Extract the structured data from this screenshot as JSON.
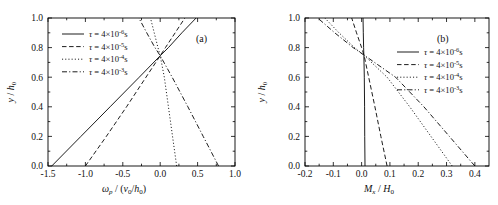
{
  "figure": {
    "background_color": "#ffffff",
    "line_color": "#111111",
    "panels": [
      "a",
      "b"
    ]
  },
  "panel_a": {
    "tag": "(a)",
    "xlabel_main": "ω",
    "xlabel_sub": "p",
    "xlabel_rest": " / (",
    "xlabel_v": "v",
    "xlabel_v_sub": "0",
    "xlabel_slash": "/",
    "xlabel_h": "h",
    "xlabel_h_sub": "0",
    "xlabel_close": ")",
    "xlabel_plain": "ωp / (v0/h0)",
    "ylabel_y": "y",
    "ylabel_slash": " / ",
    "ylabel_h": "h",
    "ylabel_h_sub": "0",
    "ylabel_plain": "y / h0",
    "xticklabels": [
      "-1.5",
      "-1.0",
      "-0.5",
      "0.0",
      "0.5",
      "1.0"
    ],
    "yticklabels": [
      "0.0",
      "0.2",
      "0.4",
      "0.6",
      "0.8",
      "1.0"
    ],
    "legend": [
      {
        "style": "solid",
        "tau": "τ",
        "eq": " = 4×10",
        "exp": "-6",
        "unit": "s"
      },
      {
        "style": "dashed",
        "tau": "τ",
        "eq": " = 4×10",
        "exp": "-5",
        "unit": "s"
      },
      {
        "style": "dotted",
        "tau": "τ",
        "eq": " = 4×10",
        "exp": "-4",
        "unit": "s"
      },
      {
        "style": "dashdot",
        "tau": "τ",
        "eq": " = 4×10",
        "exp": "-3",
        "unit": "s"
      }
    ]
  },
  "panel_b": {
    "tag": "(b)",
    "xlabel_M": "M",
    "xlabel_M_sub": "x",
    "xlabel_slash": " / ",
    "xlabel_H": "H",
    "xlabel_H_sub": "0",
    "xlabel_plain": "Mx / H0",
    "ylabel_y": "y",
    "ylabel_slash": " / ",
    "ylabel_h": "h",
    "ylabel_h_sub": "0",
    "ylabel_plain": "y / h0",
    "xticklabels": [
      "-0.2",
      "-0.1",
      "0.0",
      "0.1",
      "0.2",
      "0.3",
      "0.4"
    ],
    "yticklabels": [
      "0.0",
      "0.2",
      "0.4",
      "0.6",
      "0.8",
      "1.0"
    ],
    "legend": [
      {
        "style": "solid",
        "tau": "τ",
        "eq": " = 4×10",
        "exp": "-6",
        "unit": "s"
      },
      {
        "style": "dashed",
        "tau": "τ",
        "eq": " = 4×10",
        "exp": "-5",
        "unit": "s"
      },
      {
        "style": "dotted",
        "tau": "τ",
        "eq": " = 4×10",
        "exp": "-4",
        "unit": "s"
      },
      {
        "style": "dashdot",
        "tau": "τ",
        "eq": " = 4×10",
        "exp": "-3",
        "unit": "s"
      }
    ]
  },
  "chart_data": [
    {
      "type": "line",
      "panel": "a",
      "title": "(a)",
      "xlabel": "ωp / (v0/h0)",
      "ylabel": "y / h0",
      "xlim": [
        -1.5,
        1.0
      ],
      "ylim": [
        0.0,
        1.0
      ],
      "xticks": [
        -1.5,
        -1.0,
        -0.5,
        0.0,
        0.5,
        1.0
      ],
      "yticks": [
        0.0,
        0.2,
        0.4,
        0.6,
        0.8,
        1.0
      ],
      "grid": false,
      "legend_position": "upper-left",
      "series": [
        {
          "name": "τ = 4×10-6 s",
          "style": "solid",
          "x": [
            -1.45,
            -1.06,
            -0.67,
            -0.28,
            0.0,
            0.11,
            0.29,
            0.48
          ],
          "y": [
            0.0,
            0.2,
            0.4,
            0.6,
            0.745,
            0.8,
            0.9,
            1.0
          ]
        },
        {
          "name": "τ = 4×10-5 s",
          "style": "dashed",
          "x": [
            -1.0,
            -0.72,
            -0.45,
            -0.19,
            0.0,
            0.07,
            0.2,
            0.33
          ],
          "y": [
            0.0,
            0.2,
            0.4,
            0.6,
            0.745,
            0.8,
            0.9,
            1.0
          ]
        },
        {
          "name": "τ = 4×10-4 s",
          "style": "dotted",
          "x": [
            0.22,
            0.165,
            0.11,
            0.055,
            0.0,
            -0.03,
            -0.08,
            -0.13
          ],
          "y": [
            0.0,
            0.2,
            0.4,
            0.6,
            0.745,
            0.8,
            0.9,
            1.0
          ]
        },
        {
          "name": "τ = 4×10-3 s",
          "style": "dashdot",
          "x": [
            0.78,
            0.575,
            0.37,
            0.16,
            0.0,
            -0.07,
            -0.18,
            -0.285
          ],
          "y": [
            0.0,
            0.2,
            0.4,
            0.6,
            0.745,
            0.8,
            0.9,
            1.0
          ]
        }
      ]
    },
    {
      "type": "line",
      "panel": "b",
      "title": "(b)",
      "xlabel": "Mx / H0",
      "ylabel": "y / h0",
      "xlim": [
        -0.2,
        0.45
      ],
      "ylim": [
        0.0,
        1.0
      ],
      "xticks": [
        -0.2,
        -0.1,
        0.0,
        0.1,
        0.2,
        0.3,
        0.4
      ],
      "yticks": [
        0.0,
        0.2,
        0.4,
        0.6,
        0.8,
        1.0
      ],
      "grid": false,
      "legend_position": "upper-right",
      "series": [
        {
          "name": "τ = 4×10-6 s",
          "style": "solid",
          "x": [
            0.012,
            0.011,
            0.0105,
            0.0095,
            0.008,
            0.007,
            0.006,
            0.005
          ],
          "y": [
            0.0,
            0.2,
            0.4,
            0.6,
            0.745,
            0.8,
            0.9,
            1.0
          ]
        },
        {
          "name": "τ = 4×10-5 s",
          "style": "dashed",
          "x": [
            0.09,
            0.068,
            0.047,
            0.025,
            0.009,
            0.0,
            -0.018,
            -0.035
          ],
          "y": [
            0.0,
            0.2,
            0.4,
            0.6,
            0.745,
            0.8,
            0.9,
            1.0
          ]
        },
        {
          "name": "τ = 4×10-4 s",
          "style": "dotted",
          "x": [
            0.32,
            0.245,
            0.17,
            0.09,
            0.01,
            -0.025,
            -0.08,
            -0.13
          ],
          "y": [
            0.0,
            0.2,
            0.4,
            0.6,
            0.745,
            0.8,
            0.9,
            1.0
          ]
        },
        {
          "name": "τ = 4×10-3 s",
          "style": "dashdot",
          "x": [
            0.4,
            0.31,
            0.22,
            0.12,
            0.012,
            -0.03,
            -0.095,
            -0.155
          ],
          "y": [
            0.0,
            0.2,
            0.4,
            0.6,
            0.745,
            0.8,
            0.9,
            1.0
          ]
        }
      ]
    }
  ]
}
